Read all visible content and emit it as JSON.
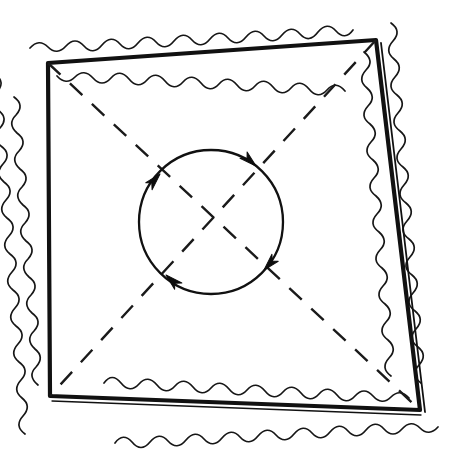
{
  "figure": {
    "type": "line-diagram",
    "background_color": "#ffffff",
    "ink_color": "#111111",
    "canvas": {
      "width": 464,
      "height": 449
    }
  },
  "chart_data": {
    "type": "diagram",
    "title": "",
    "elements": [
      {
        "name": "outer-scalloped-border",
        "kind": "wavy-outline",
        "note": "Two scalloped freehand contours running parallel on either side of each straight edge, suggesting a torn or fuzzy sheet margin."
      },
      {
        "name": "quadrilateral-frame",
        "kind": "polygon",
        "stroke": "solid-double",
        "vertices": [
          {
            "label": "top-left",
            "x": 48,
            "y": 63
          },
          {
            "label": "top-right",
            "x": 376,
            "y": 40
          },
          {
            "label": "bottom-right",
            "x": 420,
            "y": 410
          },
          {
            "label": "bottom-left",
            "x": 50,
            "y": 396
          }
        ]
      },
      {
        "name": "diagonal-top-left-to-bottom-right",
        "kind": "dashed-line",
        "from": {
          "x": 48,
          "y": 63
        },
        "to": {
          "x": 420,
          "y": 410
        }
      },
      {
        "name": "diagonal-top-right-to-bottom-left",
        "kind": "dashed-line",
        "from": {
          "x": 376,
          "y": 40
        },
        "to": {
          "x": 50,
          "y": 396
        }
      },
      {
        "name": "central-circle",
        "kind": "circle",
        "center": {
          "x": 211,
          "y": 222
        },
        "radius": 72
      }
    ],
    "arrows": [
      {
        "name": "arrow-upper-left",
        "direction": "up-left",
        "angle_deg": 223,
        "at": {
          "x": 160,
          "y": 174
        }
      },
      {
        "name": "arrow-upper-right",
        "direction": "up-right",
        "angle_deg": 312,
        "at": {
          "x": 256,
          "y": 166
        }
      },
      {
        "name": "arrow-lower-right",
        "direction": "down-right",
        "angle_deg": 43,
        "at": {
          "x": 264,
          "y": 270
        }
      },
      {
        "name": "arrow-lower-left",
        "direction": "down-left",
        "angle_deg": 133,
        "at": {
          "x": 166,
          "y": 275
        }
      }
    ],
    "annotations": [],
    "legend": [],
    "grid": false
  }
}
